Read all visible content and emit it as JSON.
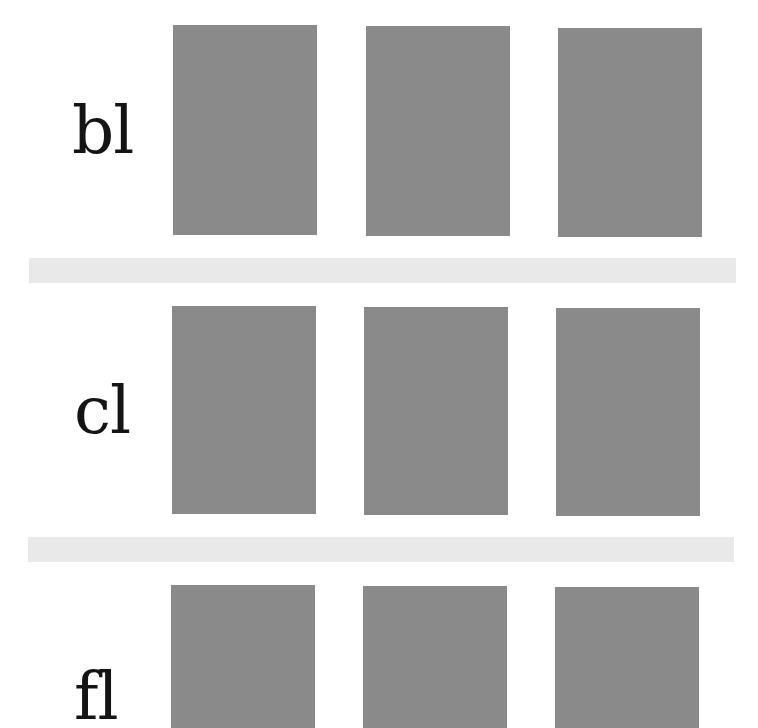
{
  "rows": [
    {
      "label": "bl"
    },
    {
      "label": "cl"
    },
    {
      "label": "fl"
    }
  ],
  "colors": {
    "swatch": "#8a8a8a",
    "separator": "#e9e9e9",
    "text": "#141414",
    "background": "#ffffff"
  }
}
